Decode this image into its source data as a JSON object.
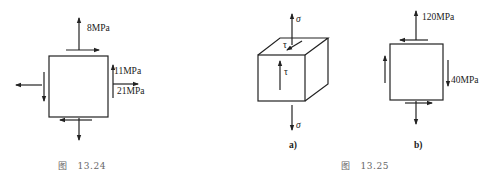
{
  "figures": [
    {
      "caption_prefix": "图",
      "caption_number": "13.24",
      "labels": {
        "top_normal": "8MPa",
        "right_shear": "11MPa",
        "right_normal": "21MPa"
      }
    },
    {
      "caption_prefix": "图",
      "caption_number": "13.25",
      "panels": [
        {
          "sublabel": "a)",
          "labels": {
            "top_sigma": "σ",
            "top_tau": "τ",
            "front_tau": "τ",
            "bottom_sigma": "σ"
          }
        },
        {
          "sublabel": "b)",
          "labels": {
            "top_normal": "120MPa",
            "right_shear": "40MPa"
          }
        }
      ]
    }
  ],
  "colors": {
    "line": "#222222",
    "caption": "#666666"
  }
}
